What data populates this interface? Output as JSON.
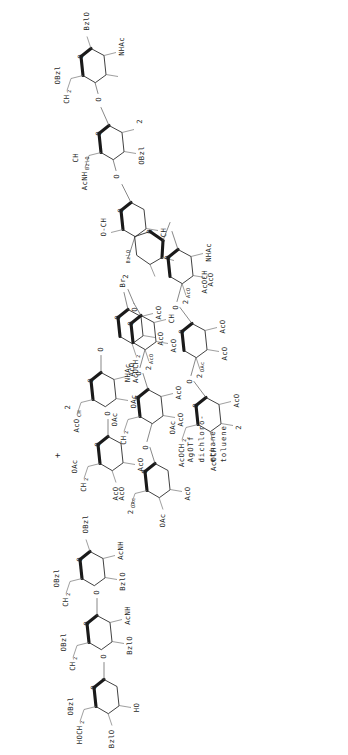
{
  "figure": {
    "kind": "chemical-reaction-scheme",
    "orientation": "rotated-90-ccw",
    "background": "#ffffff",
    "ink": "#1f1f1f",
    "plus_sign": "+"
  },
  "reagent_block": {
    "name": "reaction-conditions",
    "lines": [
      "AgOTf",
      "dichloro-",
      "ethane",
      "toluene"
    ]
  },
  "reactant_acceptor": {
    "name": "acceptor-trisaccharide",
    "role": "glycosyl acceptor",
    "labels": [
      {
        "id": "a1",
        "text": "BzlO"
      },
      {
        "id": "a2",
        "text": "HOCH"
      },
      {
        "id": "a2sub",
        "text": "2"
      },
      {
        "id": "a3",
        "text": "OBzl"
      },
      {
        "id": "a4",
        "text": "HO"
      },
      {
        "id": "a5",
        "text": "CH"
      },
      {
        "id": "a5sub",
        "text": "2"
      },
      {
        "id": "a5b",
        "text": "OBzl"
      },
      {
        "id": "a6",
        "text": "BzlO"
      },
      {
        "id": "a7",
        "text": "AcNH"
      },
      {
        "id": "a8",
        "text": "CH"
      },
      {
        "id": "a8sub",
        "text": "2"
      },
      {
        "id": "a8b",
        "text": "OBzl"
      },
      {
        "id": "a9",
        "text": "BzlO"
      },
      {
        "id": "a10",
        "text": "AcNH"
      },
      {
        "id": "a11",
        "text": "OBzl"
      },
      {
        "id": "a12",
        "text": "O"
      }
    ]
  },
  "reactant_donor": {
    "name": "donor-trisaccharide-bromide",
    "role": "glycosyl bromide donor",
    "labels": [
      {
        "id": "d1",
        "text": "AcO"
      },
      {
        "id": "d2",
        "text": "CH"
      },
      {
        "id": "d2sub",
        "text": "2"
      },
      {
        "id": "d2b",
        "text": "OAc"
      },
      {
        "id": "d3",
        "text": "AcO"
      },
      {
        "id": "d4",
        "text": "AcO"
      },
      {
        "id": "d5",
        "text": "CH"
      },
      {
        "id": "d5sub",
        "text": "2"
      },
      {
        "id": "d5b",
        "text": "OAc"
      },
      {
        "id": "d6",
        "text": "AcO"
      },
      {
        "id": "d7",
        "text": "NHAc"
      },
      {
        "id": "d8",
        "text": "AcOCH"
      },
      {
        "id": "d8sub",
        "text": "2"
      },
      {
        "id": "d9",
        "text": "AcO"
      },
      {
        "id": "d10",
        "text": "AcO"
      },
      {
        "id": "d11",
        "text": "Br"
      },
      {
        "id": "d12",
        "text": "O"
      }
    ]
  },
  "product": {
    "name": "product-branched-oligosaccharide",
    "role": "glycosylation product",
    "labels": [
      {
        "id": "p1",
        "text": "CH"
      },
      {
        "id": "p1sub",
        "text": "2"
      },
      {
        "id": "p1b",
        "text": "OBzl"
      },
      {
        "id": "p2",
        "text": "NHAc"
      },
      {
        "id": "p3",
        "text": "AcNH"
      },
      {
        "id": "p4",
        "text": "BzlO"
      },
      {
        "id": "p5",
        "text": "CH"
      },
      {
        "id": "p5sub",
        "text": "2"
      },
      {
        "id": "p5b",
        "text": "OBzl"
      },
      {
        "id": "p6",
        "text": "BzlO"
      },
      {
        "id": "p7",
        "text": "OBzl"
      },
      {
        "id": "p8",
        "text": "O-CH"
      },
      {
        "id": "p8sub",
        "text": "2"
      },
      {
        "id": "p9",
        "text": "BzlO"
      },
      {
        "id": "p10",
        "text": "CH"
      },
      {
        "id": "p10sub",
        "text": "2"
      },
      {
        "id": "p10b",
        "text": "OAc"
      },
      {
        "id": "p11",
        "text": "AcO"
      },
      {
        "id": "p12",
        "text": "AcO"
      },
      {
        "id": "p13",
        "text": "CH"
      },
      {
        "id": "p13sub",
        "text": "2"
      },
      {
        "id": "p13b",
        "text": "OAc"
      },
      {
        "id": "p14",
        "text": "AcO"
      },
      {
        "id": "p15",
        "text": "AcO"
      },
      {
        "id": "p16",
        "text": "NHAc"
      },
      {
        "id": "p17",
        "text": "AcOCH"
      },
      {
        "id": "p17sub",
        "text": "2"
      },
      {
        "id": "p18",
        "text": "AcO"
      },
      {
        "id": "p19",
        "text": "AcO"
      },
      {
        "id": "p20",
        "text": "CH"
      },
      {
        "id": "p20sub",
        "text": "2"
      },
      {
        "id": "p20b",
        "text": "OAc"
      },
      {
        "id": "p21",
        "text": "AcO"
      },
      {
        "id": "p22",
        "text": "AcO"
      },
      {
        "id": "p23",
        "text": "AcOCH"
      },
      {
        "id": "p23sub",
        "text": "2"
      },
      {
        "id": "p24",
        "text": "AcO"
      },
      {
        "id": "p25",
        "text": "AcO"
      },
      {
        "id": "p26",
        "text": "NHAc"
      },
      {
        "id": "p27",
        "text": "AcOCH"
      },
      {
        "id": "p27sub",
        "text": "2"
      },
      {
        "id": "p28",
        "text": "AcO"
      },
      {
        "id": "p29",
        "text": "AcO"
      },
      {
        "id": "p30",
        "text": "O"
      }
    ]
  },
  "glyphs": {
    "oxygen": "O"
  }
}
